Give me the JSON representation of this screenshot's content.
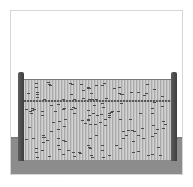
{
  "image": {
    "subject": "reed fence panel between two posts",
    "colors": {
      "background": "#ffffff",
      "frame_border": "#d6d6d6",
      "ground": "#8c8c8c",
      "panel": "#bdbdbd",
      "posts": "#4a4a4a",
      "wire": "#5a5a5a"
    }
  },
  "caption": {
    "text": "· · ·  ·  · ·  ·  ·"
  }
}
